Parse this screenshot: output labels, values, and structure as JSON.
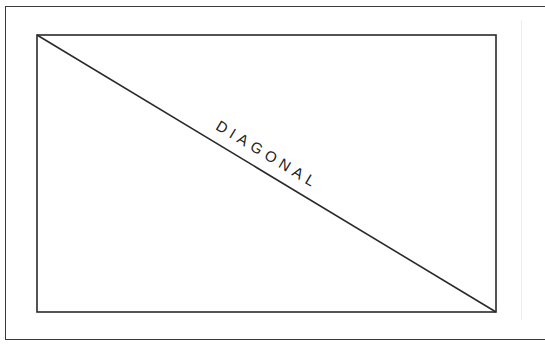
{
  "diagram": {
    "label": "DIAGONAL",
    "line_color": "#2a2a2a",
    "rectangle": {
      "x": 37,
      "y": 35,
      "width": 459,
      "height": 277
    },
    "diagonal": {
      "x1": 37,
      "y1": 35,
      "x2": 496,
      "y2": 312
    }
  }
}
